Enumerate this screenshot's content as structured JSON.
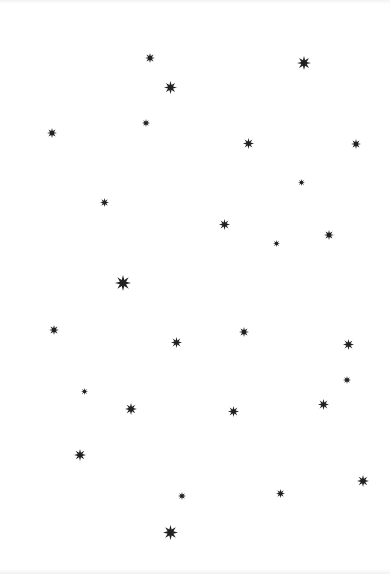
{
  "page": {
    "background_color": "#ffffff",
    "width": 390,
    "height": 574
  },
  "starfield": {
    "star_glyph": "eight-pointed-star",
    "star_color": "#212121",
    "count": 27,
    "stars": [
      {
        "x": 150,
        "y": 58,
        "size": 10
      },
      {
        "x": 304,
        "y": 63,
        "size": 14
      },
      {
        "x": 170,
        "y": 87,
        "size": 13
      },
      {
        "x": 146,
        "y": 123,
        "size": 8
      },
      {
        "x": 52,
        "y": 133,
        "size": 10
      },
      {
        "x": 248,
        "y": 143,
        "size": 11
      },
      {
        "x": 356,
        "y": 144,
        "size": 10
      },
      {
        "x": 301,
        "y": 182,
        "size": 7
      },
      {
        "x": 104,
        "y": 202,
        "size": 9
      },
      {
        "x": 224,
        "y": 224,
        "size": 11
      },
      {
        "x": 329,
        "y": 235,
        "size": 10
      },
      {
        "x": 276,
        "y": 243,
        "size": 7
      },
      {
        "x": 123,
        "y": 283,
        "size": 16
      },
      {
        "x": 54,
        "y": 330,
        "size": 10
      },
      {
        "x": 244,
        "y": 332,
        "size": 10
      },
      {
        "x": 176,
        "y": 342,
        "size": 11
      },
      {
        "x": 348,
        "y": 344,
        "size": 11
      },
      {
        "x": 347,
        "y": 380,
        "size": 8
      },
      {
        "x": 84,
        "y": 391,
        "size": 7
      },
      {
        "x": 323,
        "y": 404,
        "size": 11
      },
      {
        "x": 131,
        "y": 409,
        "size": 12
      },
      {
        "x": 233,
        "y": 411,
        "size": 11
      },
      {
        "x": 80,
        "y": 455,
        "size": 12
      },
      {
        "x": 363,
        "y": 481,
        "size": 12
      },
      {
        "x": 280,
        "y": 493,
        "size": 9
      },
      {
        "x": 182,
        "y": 496,
        "size": 8
      },
      {
        "x": 170,
        "y": 532,
        "size": 15
      }
    ]
  }
}
